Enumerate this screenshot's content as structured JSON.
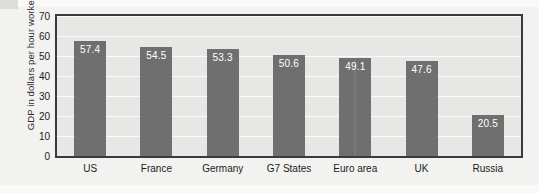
{
  "chart_data": {
    "type": "bar",
    "title": "",
    "xlabel": "",
    "ylabel": "GDP in dollars per hour worked",
    "categories": [
      "US",
      "France",
      "Germany",
      "G7 States",
      "Euro area",
      "UK",
      "Russia"
    ],
    "values": [
      57.4,
      54.5,
      53.3,
      50.6,
      49.1,
      47.6,
      20.5
    ],
    "value_labels": [
      "57.4",
      "54.5",
      "53.3",
      "50.6",
      "49.1",
      "47.6",
      "20.5"
    ],
    "ylim": [
      0,
      70
    ],
    "yticks": [
      0,
      10,
      20,
      30,
      40,
      50,
      60,
      70
    ],
    "ytick_labels": [
      "0",
      "10",
      "20",
      "30",
      "40",
      "50",
      "60",
      "70"
    ],
    "grid": true,
    "legend": "none",
    "bar_color": "#6f6f6f",
    "plot_background": "#e7e7e5",
    "gridline_color": "#fbfbfa",
    "frame_color": "#3a3a3a",
    "label_text_color": "#ffffff"
  }
}
